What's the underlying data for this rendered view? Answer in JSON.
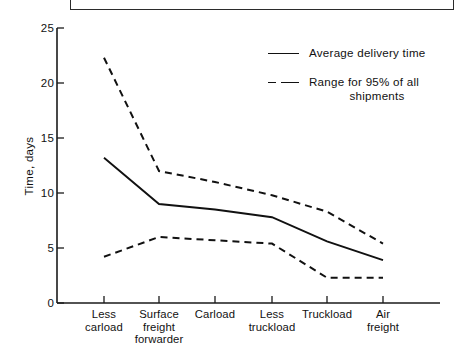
{
  "chart_data": {
    "type": "line",
    "title": "",
    "xlabel": "",
    "ylabel": "Time, days",
    "ylim": [
      0,
      25
    ],
    "yticks": [
      0,
      5,
      10,
      15,
      20,
      25
    ],
    "ytick_labels": [
      "0",
      "5",
      "10",
      "15",
      "20",
      "25"
    ],
    "grid": false,
    "legend_position": "upper right",
    "categories": [
      "Less carload",
      "Surface freight forwarder",
      "Carload",
      "Less truckload",
      "Truckload",
      "Air freight"
    ],
    "category_lines": [
      [
        "Less",
        "carload"
      ],
      [
        "Surface",
        "freight",
        "forwarder"
      ],
      [
        "Carload"
      ],
      [
        "Less",
        "truckload"
      ],
      [
        "Truckload"
      ],
      [
        "Air",
        "freight"
      ]
    ],
    "series": [
      {
        "name": "Average delivery time",
        "style": "solid",
        "values": [
          13.2,
          9.0,
          8.5,
          7.8,
          5.6,
          3.9
        ]
      },
      {
        "name": "Range for 95% of all shipments upper bound",
        "style": "dashed",
        "values": [
          22.3,
          12.0,
          11.0,
          9.8,
          8.3,
          5.4
        ]
      },
      {
        "name": "Range for 95% of all shipments lower bound",
        "style": "dashed",
        "values": [
          4.2,
          6.0,
          5.7,
          5.4,
          2.3,
          2.3
        ]
      }
    ],
    "legend_entries": [
      {
        "label": "Average delivery time",
        "style": "solid",
        "label_line2": ""
      },
      {
        "label": "Range for  95% of all",
        "style": "dashed",
        "label_line2": "shipments"
      }
    ]
  }
}
